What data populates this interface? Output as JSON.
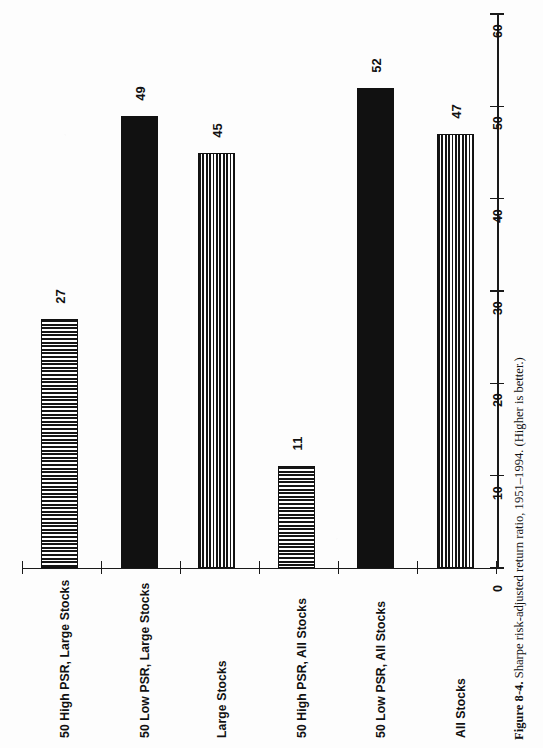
{
  "figure": {
    "caption_lead": "Figure 8-4.",
    "caption_text": " Sharpe risk-adjusted return ratio, 1951–1994. (Higher is better.)"
  },
  "chart_data": {
    "type": "bar",
    "orientation": "vertical-bars-printed-rotated-90deg",
    "title": "",
    "xlabel": "",
    "ylabel": "",
    "ylim": [
      0,
      60
    ],
    "grid": false,
    "legend": "none",
    "tick_labels": [
      "0",
      "10",
      "20",
      "30",
      "40",
      "50",
      "60"
    ],
    "tick_values": [
      0,
      10,
      20,
      30,
      40,
      50,
      60
    ],
    "categories": [
      "50 High PSR, Large Stocks",
      "50 Low PSR, Large Stocks",
      "Large Stocks",
      "50 High PSR, All Stocks",
      "50 Low PSR, All Stocks",
      "All Stocks"
    ],
    "values": [
      27,
      49,
      45,
      11,
      52,
      47
    ],
    "value_labels": [
      "27",
      "49",
      "45",
      "11",
      "52",
      "47"
    ],
    "fills": [
      "horizontal-stripes",
      "solid-black",
      "vertical-stripes",
      "horizontal-stripes",
      "solid-black",
      "vertical-stripes"
    ],
    "colors": {
      "ink": "#111111",
      "page": "#fdfdfd"
    }
  }
}
